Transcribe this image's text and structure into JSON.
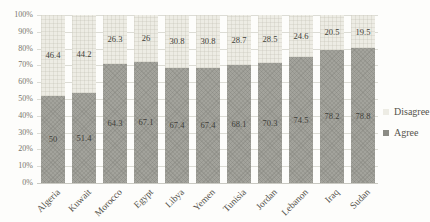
{
  "chart_data": {
    "type": "bar",
    "subtype": "stacked-100-percent-column",
    "title": "",
    "xlabel": "",
    "ylabel": "",
    "categories": [
      "Algeria",
      "Kuwait",
      "Morocco",
      "Egypt",
      "Libya",
      "Yemen",
      "Tunisia",
      "Jordan",
      "Lebanon",
      "Iraq",
      "Sudan"
    ],
    "series": [
      {
        "name": "Agree",
        "color": "#a3a39c",
        "values": [
          50,
          51.4,
          64.3,
          67.1,
          67.4,
          67.4,
          68.1,
          70.3,
          74.5,
          78.2,
          78.8
        ]
      },
      {
        "name": "Disagree",
        "color": "#edece4",
        "values": [
          46.4,
          44.2,
          26.3,
          26,
          30.8,
          30.8,
          28.7,
          28.5,
          24.6,
          20.5,
          19.5
        ]
      }
    ],
    "value_labels_shown": true,
    "y_axis": {
      "min": 0,
      "max": 100,
      "step": 10,
      "ticks": [
        "0%",
        "10%",
        "20%",
        "30%",
        "40%",
        "50%",
        "60%",
        "70%",
        "80%",
        "90%",
        "100%"
      ]
    },
    "grid": true,
    "legend": {
      "position": "right",
      "entries": [
        {
          "label": "Disagree",
          "color": "#edece4"
        },
        {
          "label": "Agree",
          "color": "#8b8b84"
        }
      ]
    }
  }
}
